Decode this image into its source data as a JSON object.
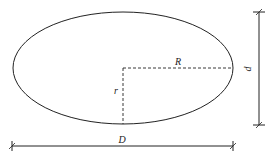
{
  "diagram": {
    "type": "ellipse-dimension-drawing",
    "labels": {
      "major_radius": "R",
      "minor_radius": "r",
      "major_diameter": "D",
      "minor_diameter": "d"
    },
    "colors": {
      "stroke": "#222222",
      "background": "#ffffff"
    }
  }
}
